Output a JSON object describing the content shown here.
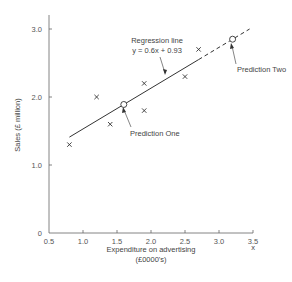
{
  "chart_data": {
    "type": "scatter",
    "title": "",
    "xlabel": "Expenditure on advertising",
    "xlabel_line2": "(£0000's)",
    "x_axis_symbol": "x",
    "ylabel": "Sales (£ million)",
    "xlim": [
      0.5,
      3.5
    ],
    "ylim": [
      0,
      3.2
    ],
    "x_ticks": [
      "0.5",
      "1.0",
      "1.5",
      "2.0",
      "2.5",
      "3.0",
      "3.5"
    ],
    "y_ticks": [
      "0",
      "1.0",
      "2.0",
      "3.0"
    ],
    "grid": false,
    "series": [
      {
        "name": "Observations",
        "marker": "x",
        "points": [
          {
            "x": 0.8,
            "y": 1.3
          },
          {
            "x": 1.2,
            "y": 2.0
          },
          {
            "x": 1.4,
            "y": 1.6
          },
          {
            "x": 1.9,
            "y": 1.8
          },
          {
            "x": 1.9,
            "y": 2.2
          },
          {
            "x": 2.5,
            "y": 2.3
          },
          {
            "x": 2.7,
            "y": 2.7
          }
        ]
      },
      {
        "name": "Predictions",
        "marker": "open-circle",
        "points": [
          {
            "x": 1.6,
            "y": 1.89,
            "label": "Prediction One"
          },
          {
            "x": 3.2,
            "y": 2.85,
            "label": "Prediction Two"
          }
        ]
      }
    ],
    "regression_line": {
      "label": "Regression line",
      "equation": "y = 0.6x + 0.93",
      "slope": 0.6,
      "intercept": 0.93,
      "solid_range": [
        0.8,
        2.7
      ],
      "dashed_range": [
        2.7,
        3.45
      ]
    },
    "annotations": [
      {
        "text": "Regression line",
        "target": "regression_line"
      },
      {
        "text": "y = 0.6x + 0.93",
        "target": "regression_line"
      },
      {
        "text": "Prediction One",
        "target": "prediction_one"
      },
      {
        "text": "Prediction Two",
        "target": "prediction_two"
      }
    ]
  },
  "colors": {
    "axis": "#666666",
    "line": "#333333",
    "marker": "#333333",
    "text": "#444444"
  }
}
